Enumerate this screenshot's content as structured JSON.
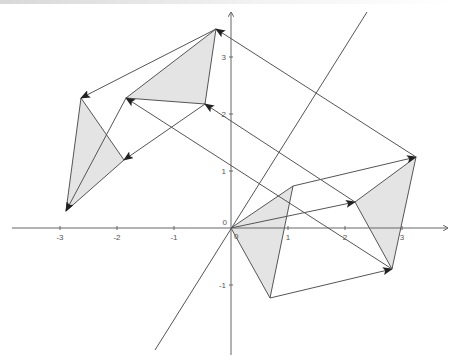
{
  "diagram": {
    "type": "coordinate-plane-vector-translations",
    "colors": {
      "axis": "#666666",
      "line": "#555555",
      "fill": "#e4e4e4",
      "arrow": "#222222",
      "label": "#555555"
    },
    "axes": {
      "origin_px": [
        231,
        228
      ],
      "unit_px": 57,
      "x_ticks": [
        {
          "value": -3,
          "label": "-3"
        },
        {
          "value": -2,
          "label": "-2"
        },
        {
          "value": -1,
          "label": "-1"
        },
        {
          "value": 1,
          "label": "1"
        },
        {
          "value": 2,
          "label": "2"
        },
        {
          "value": 3,
          "label": "3"
        }
      ],
      "y_ticks": [
        {
          "value": 3,
          "label": "3"
        },
        {
          "value": 2,
          "label": "2"
        },
        {
          "value": 1,
          "label": "1"
        },
        {
          "value": -1,
          "label": "-1"
        }
      ],
      "origin_label": "0",
      "origin_label_secondary": "0"
    },
    "reflection_line": {
      "from": [
        367,
        12
      ],
      "to": [
        155,
        350
      ]
    },
    "triangles": [
      {
        "name": "original",
        "points": [
          [
            231,
            228
          ],
          [
            293,
            186
          ],
          [
            270,
            298
          ]
        ]
      },
      {
        "name": "right-image",
        "points": [
          [
            355,
            202
          ],
          [
            416,
            157
          ],
          [
            392,
            269
          ]
        ]
      },
      {
        "name": "upper-image",
        "points": [
          [
            126,
            98
          ],
          [
            216,
            29
          ],
          [
            205,
            104
          ]
        ]
      },
      {
        "name": "left-image",
        "points": [
          [
            81,
            98
          ],
          [
            66,
            211
          ],
          [
            124,
            160
          ]
        ]
      }
    ],
    "vectors": [
      {
        "from": [
          231,
          228
        ],
        "to": [
          355,
          202
        ]
      },
      {
        "from": [
          293,
          186
        ],
        "to": [
          416,
          157
        ]
      },
      {
        "from": [
          270,
          298
        ],
        "to": [
          392,
          269
        ]
      },
      {
        "from": [
          392,
          269
        ],
        "to": [
          126,
          98
        ]
      },
      {
        "from": [
          416,
          157
        ],
        "to": [
          216,
          29
        ]
      },
      {
        "from": [
          355,
          202
        ],
        "to": [
          205,
          104
        ]
      },
      {
        "from": [
          216,
          29
        ],
        "to": [
          81,
          98
        ]
      },
      {
        "from": [
          126,
          98
        ],
        "to": [
          66,
          211
        ]
      },
      {
        "from": [
          205,
          104
        ],
        "to": [
          124,
          160
        ]
      }
    ]
  }
}
